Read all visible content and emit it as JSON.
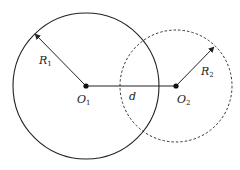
{
  "diagram": {
    "circle1": {
      "center_label": "O",
      "center_sub": "1",
      "radius_label": "R",
      "radius_sub": "1",
      "style": "solid"
    },
    "circle2": {
      "center_label": "O",
      "center_sub": "2",
      "radius_label": "R",
      "radius_sub": "2",
      "style": "dashed"
    },
    "distance_label": "d",
    "stroke_color": "#222222"
  }
}
